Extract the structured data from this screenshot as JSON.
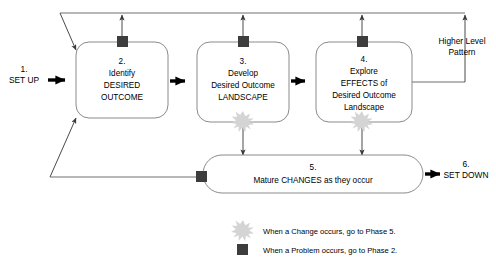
{
  "diagram": {
    "colors": {
      "box_stroke": "#8a8a8a",
      "thin_line": "#6e6e6e",
      "thick_arrow": "#000000",
      "problem_marker": "#3d3d3d",
      "change_marker": "#d4d4d4",
      "background": "#ffffff"
    },
    "entry": {
      "number": "1.",
      "label": "SET UP"
    },
    "exit": {
      "number": "6.",
      "label": "SET DOWN"
    },
    "side_label": {
      "line1": "Higher Level",
      "line2": "Pattern"
    },
    "phases": [
      {
        "number": "2.",
        "lines": [
          "Identify",
          "DESIRED",
          "OUTCOME"
        ],
        "has_problem_marker": true,
        "has_change_marker": false
      },
      {
        "number": "3.",
        "lines": [
          "Develop",
          "Desired Outcome",
          "LANDSCAPE"
        ],
        "has_problem_marker": true,
        "has_change_marker": true
      },
      {
        "number": "4.",
        "lines": [
          "Explore",
          "EFFECTS of",
          "Desired Outcome",
          "Landscape"
        ],
        "has_problem_marker": true,
        "has_change_marker": true
      }
    ],
    "mature_phase": {
      "number": "5.",
      "label": "Mature CHANGES as they occur",
      "has_problem_marker": true
    },
    "legend": [
      {
        "marker": "change-burst-icon",
        "text": "When a Change occurs, go to Phase 5."
      },
      {
        "marker": "problem-square-icon",
        "text": "When a Problem occurs, go to Phase 2."
      }
    ]
  }
}
